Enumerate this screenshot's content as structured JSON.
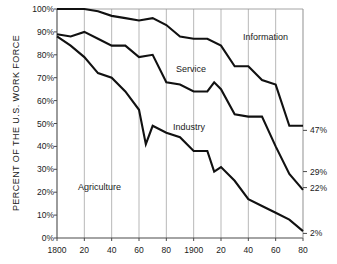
{
  "chart_data": {
    "type": "area",
    "title": "",
    "xlabel": "",
    "ylabel": "PERCENT OF THE U.S. WORK FORCE",
    "xlim": [
      1800,
      1980
    ],
    "ylim": [
      0,
      100
    ],
    "grid": "vertical-only",
    "legend": "inline-labels",
    "x_tick_labels": [
      "1800",
      "20",
      "40",
      "60",
      "80",
      "1900",
      "20",
      "40",
      "60",
      "80"
    ],
    "x_tick_values": [
      1800,
      1820,
      1840,
      1860,
      1880,
      1900,
      1920,
      1940,
      1960,
      1980
    ],
    "y_tick_labels": [
      "0%",
      "10%",
      "20%",
      "30%",
      "40%",
      "50%",
      "60%",
      "70%",
      "80%",
      "90%",
      "100%"
    ],
    "y_tick_values": [
      0,
      10,
      20,
      30,
      40,
      50,
      60,
      70,
      80,
      90,
      100
    ],
    "right_annotations": [
      {
        "label": "47%",
        "value": 47
      },
      {
        "label": "29%",
        "value": 29
      },
      {
        "label": "22%",
        "value": 22
      },
      {
        "label": "2%",
        "value": 2
      }
    ],
    "series_labels": [
      {
        "name": "Agriculture",
        "x": 78,
        "y": 182
      },
      {
        "name": "Industry",
        "x": 173,
        "y": 122
      },
      {
        "name": "Service",
        "x": 176,
        "y": 64
      },
      {
        "name": "Information",
        "x": 243,
        "y": 32
      }
    ],
    "series": [
      {
        "name": "Agriculture",
        "boundary": "agriculture-top",
        "x": [
          1800,
          1810,
          1820,
          1830,
          1840,
          1850,
          1860,
          1865,
          1870,
          1880,
          1890,
          1900,
          1910,
          1915,
          1920,
          1930,
          1940,
          1950,
          1960,
          1970,
          1980
        ],
        "values": [
          88,
          84,
          79,
          72,
          70,
          64,
          56,
          41,
          49,
          46,
          44,
          38,
          38,
          29,
          31,
          25,
          17,
          14,
          11,
          8,
          3
        ]
      },
      {
        "name": "Industry",
        "boundary": "agriculture+industry-top",
        "x": [
          1800,
          1810,
          1820,
          1830,
          1840,
          1850,
          1860,
          1870,
          1880,
          1890,
          1900,
          1910,
          1915,
          1920,
          1930,
          1940,
          1950,
          1960,
          1970,
          1980
        ],
        "values": [
          89,
          88,
          90,
          87,
          84,
          84,
          79,
          80,
          68,
          67,
          64,
          64,
          68,
          65,
          54,
          53,
          53,
          40,
          28,
          21
        ]
      },
      {
        "name": "Service",
        "boundary": "agriculture+industry+service-top",
        "x": [
          1800,
          1820,
          1830,
          1840,
          1850,
          1860,
          1870,
          1880,
          1890,
          1900,
          1910,
          1920,
          1930,
          1940,
          1950,
          1960,
          1970,
          1980
        ],
        "values": [
          100,
          100,
          99,
          97,
          96,
          95,
          96,
          93,
          88,
          87,
          87,
          84,
          75,
          75,
          69,
          67,
          49,
          49
        ]
      },
      {
        "name": "Information",
        "boundary": "top-of-chart-100-percent",
        "x": [
          1800,
          1980
        ],
        "values": [
          100,
          100
        ]
      }
    ],
    "end_values_1980": {
      "Information": 47,
      "Service": 29,
      "Industry": 22,
      "Agriculture": 2
    }
  }
}
